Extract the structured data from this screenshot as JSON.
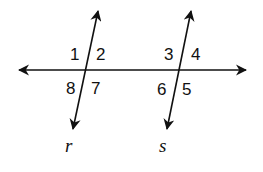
{
  "diagram": {
    "type": "parallel lines cut by a transversal",
    "transversal": {
      "from": [
        17,
        70
      ],
      "to": [
        248,
        70
      ]
    },
    "lines": [
      {
        "name": "r",
        "top": [
          98,
          10
        ],
        "bottom": [
          73,
          130
        ],
        "intersection": [
          86,
          70
        ],
        "angles": {
          "1": "1",
          "2": "2",
          "8": "8",
          "7": "7"
        }
      },
      {
        "name": "s",
        "top": [
          191,
          10
        ],
        "bottom": [
          167,
          130
        ],
        "intersection": [
          180,
          70
        ],
        "angles": {
          "3": "3",
          "4": "4",
          "6": "6",
          "5": "5"
        }
      }
    ],
    "labels": {
      "r": "r",
      "s": "s"
    },
    "angle_labels": {
      "a1": "1",
      "a2": "2",
      "a3": "3",
      "a4": "4",
      "a5": "5",
      "a6": "6",
      "a7": "7",
      "a8": "8"
    },
    "stroke_color": "#111111"
  }
}
